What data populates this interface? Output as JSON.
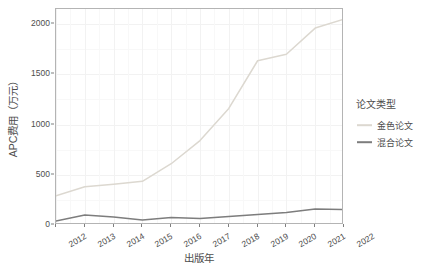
{
  "chart_data": {
    "type": "line",
    "title": "",
    "xlabel": "出版年",
    "ylabel": "APC费用（万元）",
    "x": [
      2012,
      2013,
      2014,
      2015,
      2016,
      2017,
      2018,
      2019,
      2020,
      2021,
      2022
    ],
    "categories": [
      "2012",
      "2013",
      "2014",
      "2015",
      "2016",
      "2017",
      "2018",
      "2019",
      "2020",
      "2021",
      "2022"
    ],
    "series": [
      {
        "name": "金色论文",
        "color": "#dcd8d0",
        "values": [
          290,
          380,
          405,
          435,
          610,
          840,
          1160,
          1635,
          1700,
          1960,
          2050
        ]
      },
      {
        "name": "混合论文",
        "color": "#7d7d7d",
        "values": [
          40,
          100,
          80,
          50,
          75,
          65,
          85,
          105,
          125,
          160,
          155
        ]
      }
    ],
    "xlim": [
      2012,
      2022
    ],
    "ylim": [
      0,
      2150
    ],
    "yticks": [
      0,
      500,
      1000,
      1500,
      2000
    ],
    "ytick_labels": [
      "0",
      "500",
      "1000",
      "1500",
      "2000"
    ],
    "grid": true,
    "grid_color": "#f2f2f2",
    "legend_position": "right",
    "legend_title": "论文类型",
    "panel_background": "#ffffff",
    "panel_border_color": "#b4b4b4",
    "axis_text_color": "#4d4d4d"
  },
  "legend": {
    "title": "论文类型",
    "items": [
      {
        "label": "金色论文",
        "color": "#dcd8d0"
      },
      {
        "label": "混合论文",
        "color": "#7d7d7d"
      }
    ]
  },
  "axes": {
    "x": {
      "title": "出版年",
      "ticks": [
        "2012",
        "2013",
        "2014",
        "2015",
        "2016",
        "2017",
        "2018",
        "2019",
        "2020",
        "2021",
        "2022"
      ]
    },
    "y": {
      "title": "APC费用（万元）",
      "ticks": [
        "0",
        "500",
        "1000",
        "1500",
        "2000"
      ]
    }
  }
}
